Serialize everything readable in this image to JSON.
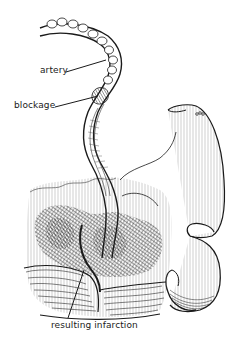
{
  "figure": {
    "style": "black ink line illustration",
    "labels": {
      "artery": "artery",
      "blockage": "blockage",
      "infarction": "resulting infarction"
    },
    "colors": {
      "ink": "#1a1a1a",
      "hatch": "#333333",
      "background": "#ffffff"
    }
  }
}
